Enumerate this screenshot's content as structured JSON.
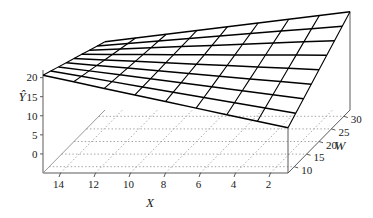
{
  "chart_data": {
    "type": "surface",
    "title": "",
    "xlabel": "X",
    "ylabel": "W",
    "zlabel": "Y-hat",
    "zlabel_display": "Ŷ",
    "x_ticks": [
      14,
      12,
      10,
      8,
      6,
      4,
      2
    ],
    "x_tick_labels": [
      "14",
      "12",
      "10",
      "8",
      "6",
      "4",
      "2"
    ],
    "x_range": [
      15,
      1
    ],
    "x_axis_direction": "decreasing-left-to-right",
    "w_ticks": [
      10,
      15,
      20,
      25,
      30
    ],
    "w_tick_labels": [
      "10",
      "15",
      "20",
      "25",
      "30"
    ],
    "w_range": [
      7.5,
      32.5
    ],
    "w_axis_direction": "increasing-upward-right",
    "z_ticks": [
      20,
      15,
      10,
      5,
      0
    ],
    "z_tick_labels": [
      "20",
      "15",
      "10",
      "5",
      "0"
    ],
    "z_range": [
      -5,
      22
    ],
    "grid": "dotted-floor-grid",
    "legend": "none",
    "mesh_rows": 9,
    "mesh_cols": 9,
    "surface_model": "z = a + b*W + c*X + d*X*W",
    "coefficients": {
      "a": 1.2,
      "b": 0.62,
      "c": 1.45,
      "d": -0.062
    },
    "corner_values": {
      "x_high_w_low": 20.0,
      "x_high_w_high": 19.5,
      "x_low_w_low": 6.5,
      "x_low_w_high": 21.0
    }
  },
  "axes": {
    "z_title": "Ŷ",
    "x_title": "X",
    "w_title": "W"
  },
  "colors": {
    "surface_line": "#000000",
    "axis_line": "#5a5a5a",
    "grid_line": "#8c8c8c",
    "text": "#1a1a1a",
    "background": "#ffffff"
  }
}
